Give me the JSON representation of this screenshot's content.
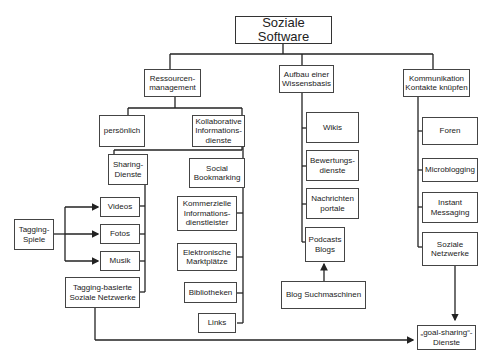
{
  "diagram": {
    "title": "Soziale Software",
    "branches": {
      "ressourcen": "Ressourcen-\nmanagement",
      "wissen": "Aufbau einer\nWissensbasis",
      "kommunikation": "Kommunikation\nKontakte knüpfen"
    },
    "ressourcen_children": {
      "persoenlich": "persönlich",
      "kollaborativ": "Kollaborative\nInformations-\ndienste"
    },
    "sharing": {
      "label": "Sharing-\nDienste",
      "items": [
        "Videos",
        "Fotos",
        "Musik"
      ],
      "tagging_networks": "Tagging-basierte\nSoziale Netzwerke"
    },
    "tagging_games": "Tagging-\nSpiele",
    "kollaborativ_items": [
      "Social\nBookmarking",
      "Kommerzielle\nInformations-\ndienstleister",
      "Elektronische\nMarktplätze",
      "Bibliotheken",
      "Links"
    ],
    "wissen_items": [
      "Wikis",
      "Bewertungs-\ndienste",
      "Nachrichten\nportale",
      "Podcasts\nBlogs"
    ],
    "blog_search": "Blog Suchmaschinen",
    "kommunikation_items": [
      "Foren",
      "Microblogging",
      "Instant\nMessaging",
      "Soziale\nNetzwerke"
    ],
    "goal_sharing": "„goal-sharing“-\nDienste"
  }
}
